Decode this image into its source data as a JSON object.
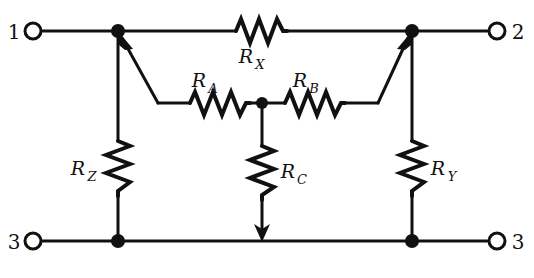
{
  "figure": {
    "type": "circuit-schematic",
    "background_color": "#ffffff",
    "line_color": "#111111"
  },
  "terminals": [
    {
      "id": "terminal-1",
      "label": "1",
      "position": "top-left",
      "x": 33,
      "y": 31,
      "label_x": 14,
      "label_y": 38
    },
    {
      "id": "terminal-2",
      "label": "2",
      "position": "top-right",
      "x": 497,
      "y": 31,
      "label_x": 510,
      "label_y": 38
    },
    {
      "id": "terminal-3-left",
      "label": "3",
      "position": "bottom-left",
      "x": 33,
      "y": 241,
      "label_x": 14,
      "label_y": 248
    },
    {
      "id": "terminal-3-right",
      "label": "3",
      "position": "bottom-right",
      "x": 497,
      "y": 241,
      "label_x": 510,
      "label_y": 248
    }
  ],
  "nodes": [
    {
      "id": "node-top-left",
      "x": 118,
      "y": 31,
      "filled": true
    },
    {
      "id": "node-top-right",
      "x": 412,
      "y": 31,
      "filled": true
    },
    {
      "id": "node-bottom-left",
      "x": 118,
      "y": 241,
      "filled": true
    },
    {
      "id": "node-bottom-right",
      "x": 412,
      "y": 241,
      "filled": true
    },
    {
      "id": "node-center",
      "x": 262,
      "y": 103,
      "filled": true
    }
  ],
  "resistors": [
    {
      "id": "resistor-rx",
      "base": "R",
      "subscript": "X",
      "orientation": "horizontal",
      "label_x": 246,
      "label_y": 63,
      "sub_x": 262,
      "sub_y": 69
    },
    {
      "id": "resistor-ra",
      "base": "R",
      "subscript": "A",
      "orientation": "horizontal",
      "label_x": 199,
      "label_y": 87,
      "sub_x": 215,
      "sub_y": 93
    },
    {
      "id": "resistor-rb",
      "base": "R",
      "subscript": "B",
      "orientation": "horizontal",
      "label_x": 300,
      "label_y": 87,
      "sub_x": 316,
      "sub_y": 93
    },
    {
      "id": "resistor-rz",
      "base": "R",
      "subscript": "Z",
      "orientation": "vertical",
      "label_x": 78,
      "label_y": 175,
      "sub_x": 94,
      "sub_y": 181
    },
    {
      "id": "resistor-rc",
      "base": "R",
      "subscript": "C",
      "orientation": "vertical",
      "label_x": 278,
      "label_y": 178,
      "sub_x": 294,
      "sub_y": 184
    },
    {
      "id": "resistor-ry",
      "base": "R",
      "subscript": "Y",
      "orientation": "vertical",
      "label_x": 434,
      "label_y": 175,
      "sub_x": 450,
      "sub_y": 181
    }
  ],
  "wires": {
    "top_rail_y": 31,
    "bottom_rail_y": 241,
    "middle_rail_y": 103,
    "left_branch_x": 118,
    "right_branch_x": 412,
    "center_branch_x": 262
  },
  "arrows": [
    {
      "id": "arrow-to-node-1",
      "from_x": 158,
      "from_y": 103,
      "to_x": 118,
      "to_y": 31,
      "direction": "up-left"
    },
    {
      "id": "arrow-to-node-2",
      "from_x": 378,
      "from_y": 103,
      "to_x": 412,
      "to_y": 31,
      "direction": "up-right"
    },
    {
      "id": "arrow-rc-down",
      "from_x": 262,
      "from_y": 200,
      "to_x": 262,
      "to_y": 241,
      "direction": "down"
    }
  ]
}
